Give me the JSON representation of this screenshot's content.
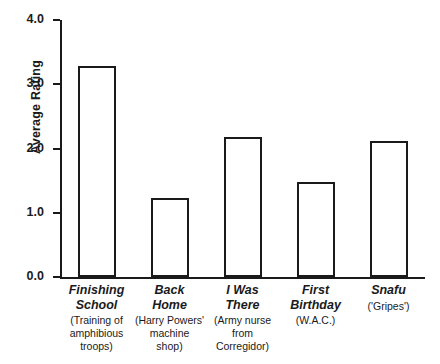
{
  "chart_data": {
    "type": "bar",
    "title": "",
    "xlabel": "",
    "ylabel": "Average Rating",
    "ylim": [
      0.0,
      4.0
    ],
    "ytick_labels": [
      "0.0",
      "1.0",
      "2.0",
      "3.0",
      "4.0"
    ],
    "ytick_values": [
      0.0,
      1.0,
      2.0,
      3.0,
      4.0
    ],
    "grid": false,
    "legend": null,
    "bar_style": "hollow-outlined",
    "categories": [
      "Finishing\nSchool",
      "Back\nHome",
      "I Was\nThere",
      "First\nBirthday",
      "Snafu"
    ],
    "category_subtitles": [
      "(Training of\namphibious\ntroops)",
      "(Harry Powers'\nmachine\nshop)",
      "(Army nurse\nfrom\nCorregidor)",
      "(W.A.C.)",
      "('Gripes')"
    ],
    "values": [
      3.25,
      1.2,
      2.15,
      1.45,
      2.08
    ]
  },
  "colors": {
    "ink": "#1a1a1a",
    "bar_fill": "#ffffff",
    "background": "#ffffff"
  }
}
